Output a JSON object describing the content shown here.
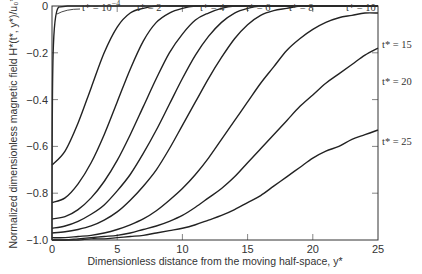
{
  "chart_data": {
    "type": "line",
    "title": "",
    "xlabel": "Dimensionless distance from the moving half-space, y*",
    "ylabel": "Normalized dimensionless magnetic field H*(t*, y*)/u0*",
    "xlim": [
      0,
      25
    ],
    "ylim": [
      -1.0,
      0
    ],
    "x_ticks": [
      0,
      5,
      10,
      15,
      20,
      25
    ],
    "y_ticks": [
      0,
      -0.2,
      -0.4,
      -0.6,
      -0.8,
      -1.0
    ],
    "x_tick_labels": [
      "0",
      "5",
      "10",
      "15",
      "20",
      "25"
    ],
    "y_tick_labels": [
      "0",
      "−0.2",
      "−0.4",
      "−0.6",
      "−0.8",
      "−1.0"
    ],
    "grid": false,
    "x": [
      0,
      1,
      2,
      3,
      4,
      5,
      6,
      7,
      8,
      9,
      10,
      11,
      12,
      13,
      14,
      15,
      16,
      17,
      18,
      19,
      20,
      21,
      22,
      23,
      24,
      25
    ],
    "series": [
      {
        "name": "t* = 10^-4",
        "values": [
          -1.0,
          -0.02,
          0,
          0,
          0,
          0,
          0,
          0,
          0,
          0,
          0,
          0,
          0,
          0,
          0,
          0,
          0,
          0,
          0,
          0,
          0,
          0,
          0,
          0,
          0,
          0
        ]
      },
      {
        "name": "t* = 2",
        "values": [
          -0.68,
          -0.62,
          -0.5,
          -0.35,
          -0.2,
          -0.09,
          -0.03,
          -0.01,
          0,
          0,
          0,
          0,
          0,
          0,
          0,
          0,
          0,
          0,
          0,
          0,
          0,
          0,
          0,
          0,
          0,
          0
        ]
      },
      {
        "name": "t* = 4",
        "values": [
          -0.84,
          -0.82,
          -0.76,
          -0.67,
          -0.55,
          -0.41,
          -0.27,
          -0.15,
          -0.07,
          -0.03,
          -0.01,
          0,
          0,
          0,
          0,
          0,
          0,
          0,
          0,
          0,
          0,
          0,
          0,
          0,
          0,
          0
        ]
      },
      {
        "name": "t* = 6",
        "values": [
          -0.91,
          -0.9,
          -0.87,
          -0.82,
          -0.75,
          -0.66,
          -0.55,
          -0.43,
          -0.31,
          -0.2,
          -0.12,
          -0.06,
          -0.03,
          -0.01,
          0,
          0,
          0,
          0,
          0,
          0,
          0,
          0,
          0,
          0,
          0,
          0
        ]
      },
      {
        "name": "t* = 8",
        "values": [
          -0.95,
          -0.94,
          -0.92,
          -0.89,
          -0.85,
          -0.79,
          -0.72,
          -0.63,
          -0.53,
          -0.42,
          -0.31,
          -0.21,
          -0.13,
          -0.07,
          -0.03,
          -0.01,
          0,
          0,
          0,
          0,
          0,
          0,
          0,
          0,
          0,
          0
        ]
      },
      {
        "name": "t* = 10",
        "values": [
          -0.97,
          -0.965,
          -0.955,
          -0.94,
          -0.915,
          -0.88,
          -0.83,
          -0.77,
          -0.7,
          -0.61,
          -0.51,
          -0.41,
          -0.31,
          -0.22,
          -0.14,
          -0.08,
          -0.04,
          -0.02,
          -0.01,
          0,
          0,
          0,
          0,
          0,
          0,
          0
        ]
      },
      {
        "name": "t* = 15",
        "values": [
          -0.99,
          -0.99,
          -0.985,
          -0.98,
          -0.97,
          -0.955,
          -0.935,
          -0.91,
          -0.875,
          -0.83,
          -0.78,
          -0.72,
          -0.65,
          -0.57,
          -0.49,
          -0.41,
          -0.33,
          -0.26,
          -0.19,
          -0.14,
          -0.1,
          -0.07,
          -0.05,
          -0.04,
          -0.03,
          -0.03
        ]
      },
      {
        "name": "t* = 20",
        "values": [
          -1.0,
          -1.0,
          -0.995,
          -0.99,
          -0.985,
          -0.98,
          -0.97,
          -0.955,
          -0.94,
          -0.92,
          -0.895,
          -0.86,
          -0.82,
          -0.78,
          -0.73,
          -0.67,
          -0.61,
          -0.55,
          -0.49,
          -0.43,
          -0.38,
          -0.33,
          -0.29,
          -0.25,
          -0.21,
          -0.18
        ]
      },
      {
        "name": "t* = 25",
        "values": [
          -1.0,
          -1.0,
          -1.0,
          -0.995,
          -0.995,
          -0.99,
          -0.985,
          -0.98,
          -0.97,
          -0.96,
          -0.95,
          -0.935,
          -0.915,
          -0.895,
          -0.87,
          -0.84,
          -0.81,
          -0.77,
          -0.73,
          -0.69,
          -0.65,
          -0.62,
          -0.6,
          -0.57,
          -0.55,
          -0.53
        ]
      }
    ],
    "annotations": [
      {
        "text": "t* = 10^-4",
        "position": "top-left, arrow to curve near y*=0"
      },
      {
        "text": "t* = 2",
        "position": "top"
      },
      {
        "text": "t* = 4",
        "position": "top"
      },
      {
        "text": "t* = 6",
        "position": "top"
      },
      {
        "text": "t* = 8",
        "position": "top"
      },
      {
        "text": "t* = 10",
        "position": "top"
      },
      {
        "text": "t* = 15",
        "position": "right"
      },
      {
        "text": "t* = 20",
        "position": "right"
      },
      {
        "text": "t* = 25",
        "position": "right"
      }
    ],
    "legend_position": "inline labels"
  },
  "labels": {
    "xlabel": "Dimensionless distance from the moving half-space, y*",
    "ylabel": "Normalized dimensionless magnetic field H*(t*, y*)/u₀*",
    "t_1e-4": "t* = 10",
    "t_1e-4_exp": "−4",
    "t2": "t* = 2",
    "t4": "t* = 4",
    "t6": "t* = 6",
    "t8": "t* = 8",
    "t10": "t* = 10",
    "t15": "t* = 15",
    "t20": "t* = 20",
    "t25": "t* = 25"
  }
}
